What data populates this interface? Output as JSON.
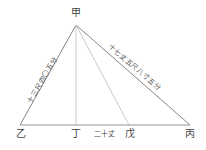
{
  "diagram": {
    "type": "triangle",
    "vertices": {
      "apex": {
        "label": "甲",
        "x": 76,
        "y": 25
      },
      "left": {
        "label": "乙",
        "x": 20,
        "y": 125
      },
      "right": {
        "label": "丙",
        "x": 190,
        "y": 125
      },
      "foot": {
        "label": "丁",
        "x": 76,
        "y": 125
      },
      "point": {
        "label": "戊",
        "x": 129,
        "y": 125
      }
    },
    "side_labels": {
      "left_side": "十三尺四〇五分",
      "right_side": "十七丈五尺八寸五分",
      "bottom_segment": "二十丈"
    },
    "colors": {
      "main_line": "#777777",
      "aux_line": "#bbbbbb",
      "text": "#444444"
    }
  }
}
